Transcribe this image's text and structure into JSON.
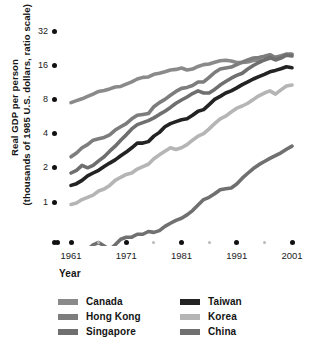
{
  "chart_data": {
    "type": "line",
    "title": "",
    "xlabel": "Year",
    "ylabel": "Real GDP per person (thousands of 1985 U.S. dollars, ratio scale)",
    "ylabel_line1": "Real GDP per person",
    "ylabel_line2": "(thousands of 1985 U.S. dollars, ratio scale)",
    "scale": "log2",
    "grid": false,
    "legend_position": "bottom",
    "ylim": [
      0.25,
      32
    ],
    "xlim": [
      1960,
      2001
    ],
    "ytick_labels": [
      "32",
      "16",
      "8",
      "4",
      "2",
      "1"
    ],
    "ytick_values": [
      32,
      16,
      8,
      4,
      2,
      1
    ],
    "xtick_labels": [
      "1961",
      "1971",
      "1981",
      "1991",
      "2001"
    ],
    "xtick_values": [
      1961,
      1971,
      1981,
      1991,
      2001
    ],
    "xtick_minor_values": [
      1966,
      1976,
      1986,
      1996
    ],
    "x": [
      1961,
      1962,
      1963,
      1964,
      1965,
      1966,
      1967,
      1968,
      1969,
      1970,
      1971,
      1972,
      1973,
      1974,
      1975,
      1976,
      1977,
      1978,
      1979,
      1980,
      1981,
      1982,
      1983,
      1984,
      1985,
      1986,
      1987,
      1988,
      1989,
      1990,
      1991,
      1992,
      1993,
      1994,
      1995,
      1996,
      1997,
      1998,
      1999,
      2000,
      2001
    ],
    "series": [
      {
        "name": "Canada",
        "color": "#8a8a8a",
        "values": [
          7.5,
          7.8,
          8.1,
          8.5,
          8.9,
          9.4,
          9.6,
          9.9,
          10.3,
          10.4,
          10.9,
          11.4,
          12.1,
          12.5,
          12.6,
          13.3,
          13.6,
          14.0,
          14.5,
          14.7,
          15.1,
          14.5,
          14.8,
          15.6,
          16.2,
          16.4,
          17.0,
          17.5,
          17.7,
          17.4,
          16.9,
          16.9,
          17.1,
          17.6,
          17.7,
          17.8,
          18.4,
          18.8,
          19.4,
          20.0,
          20.0
        ]
      },
      {
        "name": "Hong Kong",
        "color": "#7d7d7d",
        "values": [
          2.5,
          2.7,
          3.0,
          3.2,
          3.5,
          3.6,
          3.7,
          3.9,
          4.3,
          4.6,
          4.9,
          5.4,
          5.8,
          5.9,
          6.0,
          6.9,
          7.5,
          8.0,
          8.7,
          9.4,
          10.0,
          10.2,
          10.6,
          11.4,
          11.4,
          12.5,
          13.8,
          14.8,
          15.1,
          15.4,
          16.2,
          17.0,
          17.8,
          18.5,
          18.7,
          19.2,
          19.8,
          18.7,
          19.0,
          20.0,
          20.0
        ]
      },
      {
        "name": "Singapore",
        "color": "#6f6f6f",
        "values": [
          1.8,
          1.9,
          2.1,
          2.0,
          2.1,
          2.3,
          2.5,
          2.8,
          3.1,
          3.5,
          3.9,
          4.4,
          4.8,
          5.0,
          5.2,
          5.5,
          5.9,
          6.3,
          6.8,
          7.4,
          7.9,
          8.4,
          9.0,
          9.5,
          9.1,
          9.1,
          9.8,
          10.7,
          11.5,
          12.3,
          13.0,
          13.6,
          14.8,
          15.9,
          16.9,
          17.8,
          18.7,
          17.8,
          18.5,
          19.6,
          19.3
        ]
      },
      {
        "name": "Taiwan",
        "color": "#232323",
        "values": [
          1.4,
          1.45,
          1.55,
          1.7,
          1.8,
          1.9,
          2.05,
          2.2,
          2.35,
          2.55,
          2.75,
          3.0,
          3.3,
          3.3,
          3.4,
          3.8,
          4.1,
          4.6,
          4.9,
          5.1,
          5.3,
          5.4,
          5.8,
          6.3,
          6.5,
          7.2,
          8.0,
          8.5,
          9.1,
          9.5,
          10.1,
          10.8,
          11.4,
          12.1,
          12.7,
          13.3,
          14.0,
          14.4,
          14.9,
          15.5,
          15.2
        ]
      },
      {
        "name": "Korea",
        "color": "#b5b5b5",
        "values": [
          0.95,
          0.98,
          1.05,
          1.1,
          1.15,
          1.25,
          1.3,
          1.4,
          1.55,
          1.65,
          1.75,
          1.8,
          1.95,
          2.05,
          2.15,
          2.4,
          2.6,
          2.8,
          3.0,
          2.9,
          3.0,
          3.2,
          3.5,
          3.8,
          4.0,
          4.4,
          4.9,
          5.4,
          5.7,
          6.2,
          6.7,
          7.0,
          7.4,
          8.0,
          8.6,
          9.1,
          9.5,
          8.9,
          9.7,
          10.5,
          10.7
        ]
      },
      {
        "name": "China",
        "color": "#707070",
        "values": [
          0.3,
          0.31,
          0.34,
          0.38,
          0.42,
          0.44,
          0.41,
          0.38,
          0.42,
          0.47,
          0.49,
          0.49,
          0.52,
          0.52,
          0.55,
          0.54,
          0.56,
          0.61,
          0.65,
          0.69,
          0.72,
          0.77,
          0.84,
          0.94,
          1.05,
          1.1,
          1.18,
          1.28,
          1.31,
          1.33,
          1.44,
          1.62,
          1.79,
          1.97,
          2.13,
          2.27,
          2.42,
          2.56,
          2.71,
          2.91,
          3.1
        ]
      }
    ]
  },
  "axes": {
    "y_title_line1": "Real GDP per person",
    "y_title_line2": "(thousands of 1985 U.S. dollars, ratio scale)",
    "x_title": "Year"
  },
  "legend": {
    "columns": [
      {
        "items": [
          {
            "label": "Canada",
            "color": "#8a8a8a"
          },
          {
            "label": "Hong Kong",
            "color": "#7d7d7d"
          },
          {
            "label": "Singapore",
            "color": "#6f6f6f"
          }
        ]
      },
      {
        "items": [
          {
            "label": "Taiwan",
            "color": "#232323"
          },
          {
            "label": "Korea",
            "color": "#b5b5b5"
          },
          {
            "label": "China",
            "color": "#707070"
          }
        ]
      }
    ]
  },
  "colors": {
    "background": "#ffffff",
    "text": "#141414",
    "tick_dot": "#111111",
    "tick_dot_minor": "#b9b9b9"
  }
}
